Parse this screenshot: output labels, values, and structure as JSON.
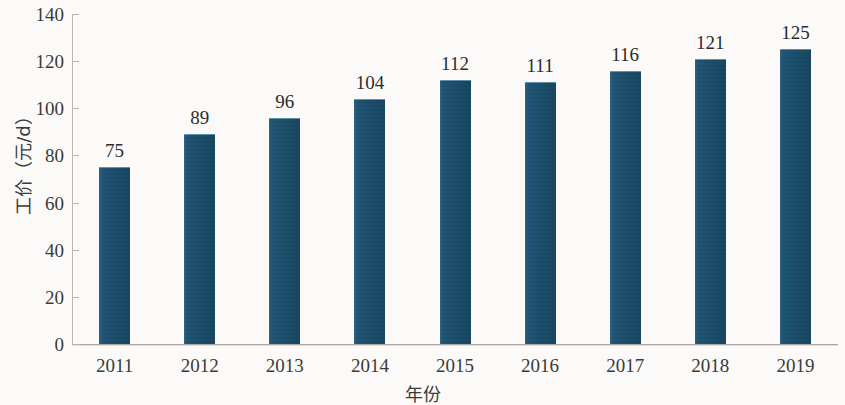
{
  "chart_data": {
    "type": "bar",
    "title": "",
    "subtitle": "",
    "xlabel": "年份",
    "ylabel": "工价（元/d）",
    "categories": [
      "2011",
      "2012",
      "2013",
      "2014",
      "2015",
      "2016",
      "2017",
      "2018",
      "2019"
    ],
    "values": [
      75,
      89,
      96,
      104,
      112,
      111,
      116,
      121,
      125
    ],
    "value_labels": [
      "75",
      "89",
      "96",
      "104",
      "112",
      "111",
      "116",
      "121",
      "125"
    ],
    "series": [
      {
        "name": "工价",
        "values": [
          75,
          89,
          96,
          104,
          112,
          111,
          116,
          121,
          125
        ]
      }
    ],
    "ylim": [
      0,
      140
    ],
    "ytick_values": [
      0,
      20,
      40,
      60,
      80,
      100,
      120,
      140
    ],
    "ytick_labels": [
      "0",
      "20",
      "40",
      "60",
      "80",
      "100",
      "120",
      "140"
    ],
    "grid": false,
    "legend": false,
    "legend_position": "none",
    "bar_color": "#1d5373",
    "background_color": "#fbfaf8",
    "axis_color": "#b9b7b4",
    "text_color": "#3a3a3a"
  }
}
